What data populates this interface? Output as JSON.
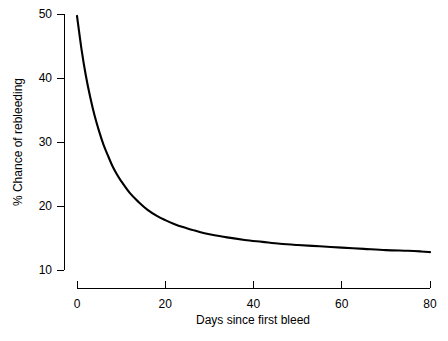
{
  "chart_data": {
    "type": "line",
    "title": "",
    "xlabel": "Days since first bleed",
    "ylabel": "% Chance of rebleeding",
    "xlim": [
      0,
      80
    ],
    "ylim": [
      10,
      50
    ],
    "xticks": [
      0,
      20,
      40,
      60,
      80
    ],
    "xtick_labels": [
      "0",
      "20",
      "40",
      "60",
      "80"
    ],
    "yticks": [
      10,
      20,
      30,
      40,
      50
    ],
    "ytick_labels": [
      "10",
      "20",
      "30",
      "40",
      "50"
    ],
    "grid": false,
    "legend": null,
    "series": [
      {
        "name": "Chance of rebleeding",
        "color": "#000000",
        "x": [
          0,
          1,
          2,
          3,
          4,
          5,
          6,
          7,
          8,
          9,
          10,
          12,
          14,
          16,
          18,
          20,
          22,
          24,
          26,
          28,
          30,
          34,
          38,
          42,
          46,
          50,
          55,
          60,
          65,
          70,
          75,
          78,
          80
        ],
        "y": [
          49.7,
          44.6,
          40.4,
          37.0,
          34.1,
          31.7,
          29.6,
          27.9,
          26.3,
          25.0,
          23.9,
          22.0,
          20.6,
          19.4,
          18.5,
          17.8,
          17.2,
          16.7,
          16.3,
          15.9,
          15.6,
          15.1,
          14.7,
          14.4,
          14.1,
          13.9,
          13.7,
          13.5,
          13.3,
          13.1,
          13.0,
          12.9,
          12.8
        ]
      }
    ],
    "annotations": []
  },
  "geometry": {
    "plot_left_px": 77,
    "plot_right_px": 430,
    "plot_top_px": 14,
    "plot_bottom_px": 270
  }
}
